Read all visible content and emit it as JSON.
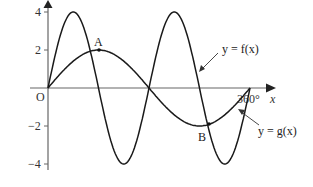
{
  "chart_data": {
    "type": "line",
    "title": "",
    "xlabel": "x",
    "ylabel": "",
    "xlim": [
      0,
      360
    ],
    "ylim": [
      -4,
      4
    ],
    "x_unit": "degrees",
    "y_ticks": [
      4,
      2,
      -2,
      -4
    ],
    "x_tick_labels": [
      {
        "x": 360,
        "label": "360°"
      }
    ],
    "origin_label": "O",
    "grid": false,
    "series": [
      {
        "name": "y = f(x)",
        "expression": "4 sin(2x)",
        "amplitude": 4,
        "frequency": 2,
        "x": [
          0,
          45,
          90,
          135,
          180,
          225,
          270,
          315,
          360
        ],
        "values": [
          0,
          4,
          0,
          -4,
          0,
          4,
          0,
          -4,
          0
        ]
      },
      {
        "name": "y = g(x)",
        "expression": "2 sin(x)",
        "amplitude": 2,
        "frequency": 1,
        "x": [
          0,
          90,
          180,
          270,
          360
        ],
        "values": [
          0,
          2,
          0,
          -2,
          0
        ]
      }
    ],
    "annotations": [
      {
        "label": "A",
        "x": 90,
        "y": 2
      },
      {
        "label": "B",
        "x": 270,
        "y": -2
      }
    ]
  },
  "labels": {
    "f_curve": "y = f(x)",
    "g_curve": "y = g(x)",
    "x_axis": "x",
    "origin": "O",
    "x_end": "360°",
    "point_a": "A",
    "point_b": "B",
    "tick_4": "4",
    "tick_2": "2",
    "tick_m2": "−2",
    "tick_m4": "−4"
  },
  "colors": {
    "curve": "#1a1a1a",
    "axis": "#555555"
  }
}
